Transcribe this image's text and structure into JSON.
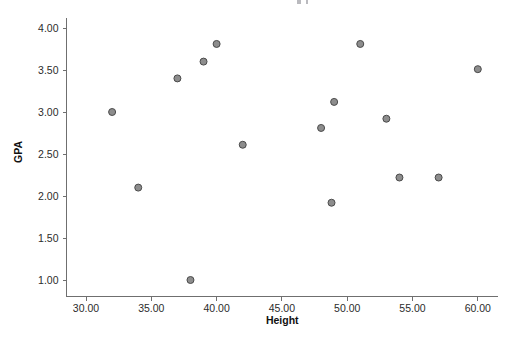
{
  "chart_data": {
    "type": "scatter",
    "title": "",
    "xlabel": "Height",
    "ylabel": "GPA",
    "xlim": [
      28.0,
      61.5
    ],
    "ylim": [
      0.72,
      4.2
    ],
    "grid": false,
    "legend": null,
    "x_ticks": [
      30.0,
      35.0,
      40.0,
      45.0,
      50.0,
      55.0,
      60.0
    ],
    "x_tick_labels": [
      "30.00",
      "35.00",
      "40.00",
      "45.00",
      "50.00",
      "55.00",
      "60.00"
    ],
    "y_ticks": [
      1.0,
      1.5,
      2.0,
      2.5,
      3.0,
      3.5,
      4.0
    ],
    "y_tick_labels": [
      "1.00",
      "1.50",
      "2.00",
      "2.50",
      "3.00",
      "3.50",
      "4.00"
    ],
    "marker": {
      "shape": "circle",
      "fill_color": "#8d8d8d",
      "edge_color": "#4a4a4a",
      "radius_px": 3.5
    },
    "points": [
      {
        "x": 32.0,
        "y": 3.0
      },
      {
        "x": 34.0,
        "y": 2.1
      },
      {
        "x": 37.0,
        "y": 3.4
      },
      {
        "x": 38.0,
        "y": 1.0
      },
      {
        "x": 39.0,
        "y": 3.6
      },
      {
        "x": 40.0,
        "y": 3.81
      },
      {
        "x": 42.0,
        "y": 2.61
      },
      {
        "x": 48.0,
        "y": 2.81
      },
      {
        "x": 48.8,
        "y": 1.92
      },
      {
        "x": 49.0,
        "y": 3.12
      },
      {
        "x": 51.0,
        "y": 3.81
      },
      {
        "x": 53.0,
        "y": 2.92
      },
      {
        "x": 54.0,
        "y": 2.22
      },
      {
        "x": 57.0,
        "y": 2.22
      },
      {
        "x": 60.0,
        "y": 3.51
      }
    ],
    "x_values": [
      32.0,
      34.0,
      37.0,
      38.0,
      39.0,
      40.0,
      42.0,
      48.0,
      48.8,
      49.0,
      51.0,
      53.0,
      54.0,
      57.0,
      60.0
    ],
    "y_values": [
      3.0,
      2.1,
      3.4,
      1.0,
      3.6,
      3.81,
      2.61,
      2.81,
      1.92,
      3.12,
      3.81,
      2.92,
      2.22,
      2.22,
      3.51
    ]
  },
  "colors": {
    "background": "#ffffff",
    "axis": "#6f6f6f",
    "text": "#1a1a1a",
    "marker_fill": "#8d8d8d",
    "marker_edge": "#4a4a4a"
  }
}
